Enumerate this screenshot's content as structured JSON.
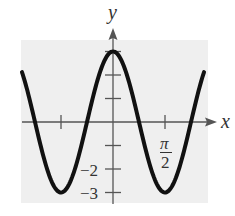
{
  "chart_data": {
    "type": "line",
    "title": "",
    "xlabel": "x",
    "ylabel": "y",
    "function": "y = 3cos(2x)",
    "x_range": [
      -2.75,
      2.75
    ],
    "ylim": [
      -3.3,
      3.6
    ],
    "grid": false,
    "background_color": "#efefef",
    "curve_color": "#111111",
    "x_ticks": [
      {
        "value": -1.5708,
        "label": ""
      },
      {
        "value": 1.5708,
        "label_num": "π",
        "label_den": "2"
      }
    ],
    "y_ticks": [
      {
        "value": 3,
        "label": ""
      },
      {
        "value": 2,
        "label": ""
      },
      {
        "value": 1,
        "label": ""
      },
      {
        "value": -1,
        "label": ""
      },
      {
        "value": -2,
        "label": "−2"
      },
      {
        "value": -3,
        "label": "−3"
      }
    ],
    "key_points": [
      {
        "x": -1.5708,
        "y": -3
      },
      {
        "x": 0,
        "y": 3
      },
      {
        "x": 1.5708,
        "y": -3
      }
    ]
  },
  "labels": {
    "x_axis": "x",
    "y_axis": "y",
    "tick_neg2": "−2",
    "tick_neg3": "−3",
    "pi_num": "π",
    "pi_den": "2"
  }
}
